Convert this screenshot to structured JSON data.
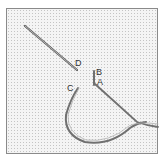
{
  "diagram": {
    "type": "embroidery-stitch-illustration",
    "labels": [
      {
        "id": "D",
        "text": "D"
      },
      {
        "id": "B",
        "text": "B"
      },
      {
        "id": "A",
        "text": "A"
      },
      {
        "id": "C",
        "text": "C"
      }
    ],
    "colors": {
      "fabric": "#f4f4f4",
      "grid_dot": "#c4c4c4",
      "needle": "#6e6e6e",
      "thread": "#7a7a7a",
      "border": "#8a8a8a"
    }
  }
}
